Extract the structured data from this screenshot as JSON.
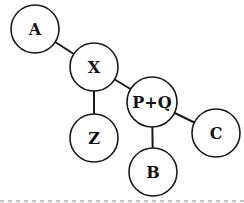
{
  "diagram": {
    "type": "tree",
    "nodes": [
      {
        "id": "A",
        "label": "A",
        "cx": 35,
        "cy": 29,
        "r": 24
      },
      {
        "id": "X",
        "label": "X",
        "cx": 94,
        "cy": 67,
        "r": 24
      },
      {
        "id": "Z",
        "label": "Z",
        "cx": 94,
        "cy": 138,
        "r": 24
      },
      {
        "id": "PQ",
        "label": "P+Q",
        "cx": 152,
        "cy": 102,
        "r": 25
      },
      {
        "id": "B",
        "label": "B",
        "cx": 153,
        "cy": 172,
        "r": 24
      },
      {
        "id": "C",
        "label": "C",
        "cx": 216,
        "cy": 133,
        "r": 24
      }
    ],
    "edges": [
      {
        "from": "A",
        "to": "X"
      },
      {
        "from": "X",
        "to": "Z"
      },
      {
        "from": "X",
        "to": "PQ"
      },
      {
        "from": "PQ",
        "to": "B"
      },
      {
        "from": "PQ",
        "to": "C"
      }
    ],
    "colors": {
      "stroke": "#1a1a1a",
      "fill": "#ffffff",
      "text": "#111111"
    }
  }
}
